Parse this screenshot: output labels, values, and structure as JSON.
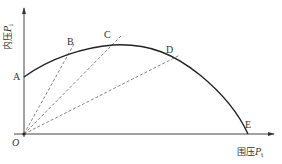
{
  "diagram": {
    "type": "curve-with-rays",
    "axes": {
      "y_label_text": "内压",
      "y_label_var": "P",
      "y_label_sub": "i",
      "x_label_text": "围压",
      "x_label_var": "P",
      "x_label_sub": "t",
      "origin_label": "O"
    },
    "points": [
      {
        "label": "A",
        "x": 24,
        "y": 77
      },
      {
        "label": "B",
        "x": 70,
        "y": 52
      },
      {
        "label": "C",
        "x": 113,
        "y": 45
      },
      {
        "label": "D",
        "x": 171,
        "y": 60
      },
      {
        "label": "E",
        "x": 248,
        "y": 134
      }
    ],
    "rays_from_origin_through": [
      "B",
      "C",
      "D"
    ],
    "colors": {
      "curve": "#222222",
      "axis": "#444444",
      "dashed": "#777777",
      "text": "#333333"
    }
  },
  "labels": {
    "A": "A",
    "B": "B",
    "C": "C",
    "D": "D",
    "E": "E",
    "O": "O"
  }
}
